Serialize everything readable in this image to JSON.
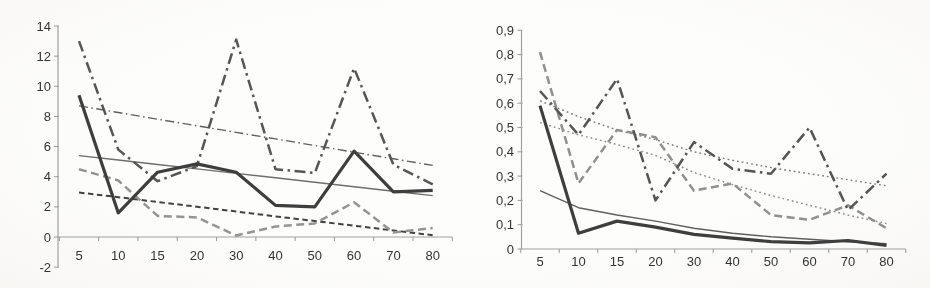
{
  "page": {
    "kind": "scanned page with two Excel-style line charts, no titles, no legend",
    "palette": {
      "paper": "#fdfdfc",
      "axis_line": "#a0a0a0",
      "tick_label": "#333333"
    }
  },
  "chart_data": [
    {
      "type": "line",
      "title": "",
      "xlabel": "",
      "ylabel": "",
      "grid": false,
      "legend": "none",
      "decimal_separator": "period",
      "categories": [
        5,
        10,
        15,
        20,
        30,
        40,
        50,
        60,
        70,
        80
      ],
      "x_tick_labels": [
        "5",
        "10",
        "15",
        "20",
        "30",
        "40",
        "50",
        "60",
        "70",
        "80"
      ],
      "ylim": [
        -2,
        14
      ],
      "y_ticks": [
        {
          "value": 14,
          "label": "14"
        },
        {
          "value": 12,
          "label": "12"
        },
        {
          "value": 10,
          "label": "10"
        },
        {
          "value": 8,
          "label": "8"
        },
        {
          "value": 6,
          "label": "6"
        },
        {
          "value": 4,
          "label": "4"
        },
        {
          "value": 2,
          "label": "2"
        },
        {
          "value": 0,
          "label": "0"
        },
        {
          "value": -2,
          "label": "-2"
        }
      ],
      "series": [
        {
          "name": "trend-linear-dashdot",
          "role": "trendline",
          "line_style": "dash-dot",
          "weight": "thin",
          "color": "#606060",
          "values": [
            8.7,
            8.26,
            7.82,
            7.38,
            6.94,
            6.51,
            6.07,
            5.63,
            5.19,
            4.75
          ]
        },
        {
          "name": "trend-linear-solid",
          "role": "trendline",
          "line_style": "solid",
          "weight": "thin",
          "color": "#6e6e6e",
          "values": [
            5.4,
            5.11,
            4.81,
            4.52,
            4.22,
            3.93,
            3.63,
            3.34,
            3.04,
            2.75
          ]
        },
        {
          "name": "trend-linear-dashed",
          "role": "trendline",
          "line_style": "dashed",
          "weight": "mid",
          "color": "#424242",
          "values": [
            2.95,
            2.64,
            2.32,
            2.01,
            1.69,
            1.37,
            1.06,
            0.75,
            0.43,
            0.12
          ]
        },
        {
          "name": "data-dashed-gray",
          "role": "data",
          "line_style": "dashed",
          "weight": "thick",
          "color": "#949494",
          "values": [
            4.5,
            3.75,
            1.4,
            1.3,
            0.1,
            0.7,
            0.9,
            2.3,
            0.3,
            0.6
          ]
        },
        {
          "name": "data-dashdot",
          "role": "data",
          "line_style": "dash-dot",
          "weight": "thick",
          "color": "#565656",
          "values": [
            13.0,
            5.8,
            3.7,
            4.7,
            13.1,
            4.5,
            4.25,
            11.2,
            4.8,
            3.5
          ]
        },
        {
          "name": "data-solid",
          "role": "data",
          "line_style": "solid",
          "weight": "thick",
          "color": "#3e3e3e",
          "values": [
            9.4,
            1.6,
            4.3,
            4.85,
            4.3,
            2.1,
            2.0,
            5.7,
            3.0,
            3.1
          ]
        }
      ]
    },
    {
      "type": "line",
      "title": "",
      "xlabel": "",
      "ylabel": "",
      "grid": false,
      "legend": "none",
      "decimal_separator": "comma",
      "categories": [
        5,
        10,
        15,
        20,
        30,
        40,
        50,
        60,
        70,
        80
      ],
      "x_tick_labels": [
        "5",
        "10",
        "15",
        "20",
        "30",
        "40",
        "50",
        "60",
        "70",
        "80"
      ],
      "ylim": [
        0,
        0.9
      ],
      "y_ticks": [
        {
          "value": 0.9,
          "label": "0,9"
        },
        {
          "value": 0.8,
          "label": "0,8"
        },
        {
          "value": 0.7,
          "label": "0,7"
        },
        {
          "value": 0.6,
          "label": "0,6"
        },
        {
          "value": 0.5,
          "label": "0,5"
        },
        {
          "value": 0.4,
          "label": "0,4"
        },
        {
          "value": 0.3,
          "label": "0,3"
        },
        {
          "value": 0.2,
          "label": "0,2"
        },
        {
          "value": 0.1,
          "label": "0,1"
        },
        {
          "value": 0,
          "label": "0"
        }
      ],
      "series": [
        {
          "name": "trend-dotted-upper",
          "role": "trendline",
          "line_style": "dotted",
          "weight": "thin",
          "color": "#7a7a7a",
          "values": [
            0.61,
            0.545,
            0.49,
            0.45,
            0.4,
            0.365,
            0.335,
            0.31,
            0.285,
            0.26
          ]
        },
        {
          "name": "trend-dotted-lower",
          "role": "trendline",
          "line_style": "dotted",
          "weight": "thin",
          "color": "#8c8c8c",
          "values": [
            0.52,
            0.47,
            0.43,
            0.385,
            0.315,
            0.265,
            0.22,
            0.18,
            0.14,
            0.105
          ]
        },
        {
          "name": "trend-power-solid",
          "role": "trendline",
          "line_style": "solid",
          "weight": "thin",
          "color": "#5f5f5f",
          "values": [
            0.24,
            0.17,
            0.14,
            0.115,
            0.085,
            0.065,
            0.05,
            0.04,
            0.03,
            0.022
          ]
        },
        {
          "name": "data-dashed-gray",
          "role": "data",
          "line_style": "dashed",
          "weight": "thick",
          "color": "#909090",
          "values": [
            0.81,
            0.27,
            0.49,
            0.46,
            0.24,
            0.27,
            0.14,
            0.12,
            0.18,
            0.085
          ]
        },
        {
          "name": "data-dashdot",
          "role": "data",
          "line_style": "dash-dot",
          "weight": "thick",
          "color": "#555555",
          "values": [
            0.65,
            0.47,
            0.7,
            0.2,
            0.44,
            0.33,
            0.31,
            0.5,
            0.16,
            0.31
          ]
        },
        {
          "name": "data-solid",
          "role": "data",
          "line_style": "solid",
          "weight": "thick",
          "color": "#3e3e3e",
          "values": [
            0.59,
            0.065,
            0.115,
            0.09,
            0.06,
            0.045,
            0.03,
            0.025,
            0.035,
            0.015
          ]
        }
      ]
    }
  ]
}
